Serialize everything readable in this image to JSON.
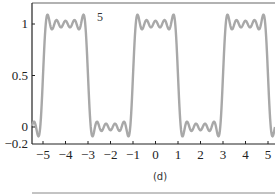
{
  "chart_data": {
    "type": "line",
    "title": "",
    "xlabel": "",
    "ylabel": "",
    "xlim": [
      -5.5,
      5.35
    ],
    "ylim": [
      -0.2,
      1.2
    ],
    "x_ticks": [
      "−5",
      "−4",
      "−3",
      "−2",
      "−1",
      "0",
      "1",
      "2",
      "3",
      "4",
      "5"
    ],
    "x_tick_values": [
      -5,
      -4,
      -3,
      -2,
      -1,
      0,
      1,
      2,
      3,
      4,
      5
    ],
    "y_ticks": [
      "1",
      "0.5",
      "0",
      "−0.2"
    ],
    "y_tick_values": [
      1,
      0.5,
      0,
      -0.2
    ],
    "grid": false,
    "annotation": "5",
    "caption": "(d)",
    "series": [
      {
        "name": "Fourier partial sum N=5 of square wave (period 4)",
        "function": "0.5 + (2/pi) * sum_{k odd, k<=9} (-1)^((k-1)/2) * cos(k*pi*x/2)/k",
        "harmonics": 5,
        "period": 4,
        "color": "#a8a8a8"
      }
    ],
    "colors": {
      "curve": "#a8a8a8",
      "axis": "#333333",
      "bottom_rule": "#888888"
    }
  }
}
